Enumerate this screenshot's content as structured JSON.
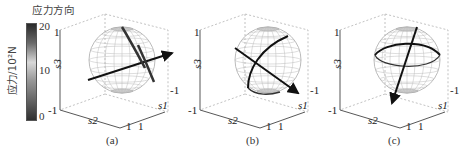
{
  "legend": {
    "title": "应力方向",
    "colorbar_label": "应力/10²N",
    "ticks": [
      "20",
      "10",
      "0"
    ]
  },
  "panels": [
    {
      "caption": "(a)",
      "z_axis": "s3",
      "x_axis": "s2",
      "y_axis": "s1",
      "ticks": {
        "z_top": "1",
        "z_bottom": "-1",
        "x_end": "1",
        "y_start": "1",
        "y_end": "-1"
      }
    },
    {
      "caption": "(b)",
      "z_axis": "s3",
      "x_axis": "s2",
      "y_axis": "s1",
      "ticks": {
        "z_top": "1",
        "z_bottom": "-1",
        "x_end": "1",
        "y_start": "1",
        "y_end": "-1"
      }
    },
    {
      "caption": "(c)",
      "z_axis": "s3",
      "x_axis": "s2",
      "y_axis": "s1",
      "ticks": {
        "z_top": "1",
        "z_bottom": "-1",
        "x_end": "1",
        "y_start": "1",
        "y_end": "-1"
      }
    }
  ]
}
